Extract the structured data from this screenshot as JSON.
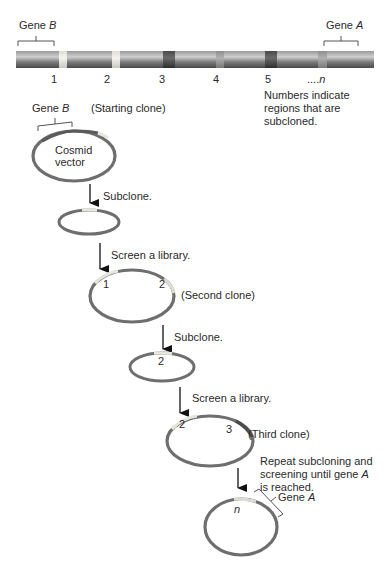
{
  "chromosome": {
    "gene_b_label": "Gene ",
    "gene_b_italic": "B",
    "gene_a_label": "Gene ",
    "gene_a_italic": "A",
    "region_labels": [
      "1",
      "2",
      "3",
      "4",
      "5"
    ],
    "region_n_prefix": "....",
    "region_n": "n",
    "note_line1": "Numbers indicate",
    "note_line2": "regions that are",
    "note_line3": "subcloned."
  },
  "starting_clone": {
    "gene_label": "Gene ",
    "gene_italic": "B",
    "caption": "(Starting clone)",
    "vector_line1": "Cosmid",
    "vector_line2": "vector"
  },
  "steps": {
    "subclone1": "Subclone.",
    "screen1": "Screen a library.",
    "subclone2": "Subclone.",
    "screen2": "Screen a library.",
    "repeat_line1": "Repeat subcloning and",
    "repeat_line2_prefix": "screening until gene ",
    "repeat_line2_italic": "A",
    "repeat_line3": "is reached."
  },
  "second_clone": {
    "caption": "(Second clone)",
    "region_left": "1",
    "region_right": "2"
  },
  "subclone2_region": "2",
  "third_clone": {
    "caption": "(Third clone)",
    "region_left": "2",
    "region_right": "3"
  },
  "final_clone": {
    "region": "n",
    "gene_label": "Gene ",
    "gene_italic": "A"
  },
  "colors": {
    "chromosome_base": "#6b6b6b",
    "band_light": "#e8e8e0",
    "band_dark": "#3a3a3a",
    "band_mid": "#9a9a9a",
    "ring": "#6e6e6e",
    "ring_highlight": "#e6e6dc"
  }
}
